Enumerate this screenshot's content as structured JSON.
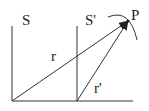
{
  "diagram": {
    "frame_s_label": "S",
    "frame_s_prime_label": "S'",
    "point_label": "P",
    "vector_r_label": "r",
    "vector_r_prime_label": "r'",
    "stroke_color": "#333333",
    "text_color": "#222222"
  }
}
